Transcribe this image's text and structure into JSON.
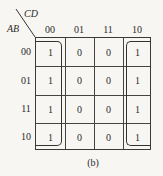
{
  "kmap": {
    "row_var": "AB",
    "col_var": "CD",
    "col_headers": [
      "00",
      "01",
      "11",
      "10"
    ],
    "row_headers": [
      "00",
      "01",
      "11",
      "10"
    ],
    "cells": [
      [
        "1",
        "0",
        "0",
        "1"
      ],
      [
        "1",
        "0",
        "0",
        "1"
      ],
      [
        "1",
        "0",
        "0",
        "1"
      ],
      [
        "1",
        "0",
        "0",
        "1"
      ]
    ],
    "groups": [
      {
        "name": "left-column-group",
        "cols": [
          0
        ],
        "rows": [
          0,
          1,
          2,
          3
        ]
      },
      {
        "name": "right-column-group",
        "cols": [
          3
        ],
        "rows": [
          0,
          1,
          2,
          3
        ]
      }
    ]
  },
  "caption": "(b)"
}
